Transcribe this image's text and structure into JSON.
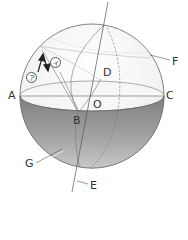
{
  "diagram": {
    "points": {
      "A": "A",
      "B": "B",
      "C": "C",
      "D": "D",
      "E": "E",
      "F": "F",
      "G": "G",
      "O": "O"
    },
    "circled_labels": {
      "a": "ア",
      "i": "イ"
    },
    "colors": {
      "stroke": "#555555",
      "upper_fill": "#f4f4f4",
      "lower_shade_top": "#8a8a8a",
      "lower_shade_bottom": "#bdbdbd",
      "horizon_fill": "#f7f7f7"
    }
  }
}
